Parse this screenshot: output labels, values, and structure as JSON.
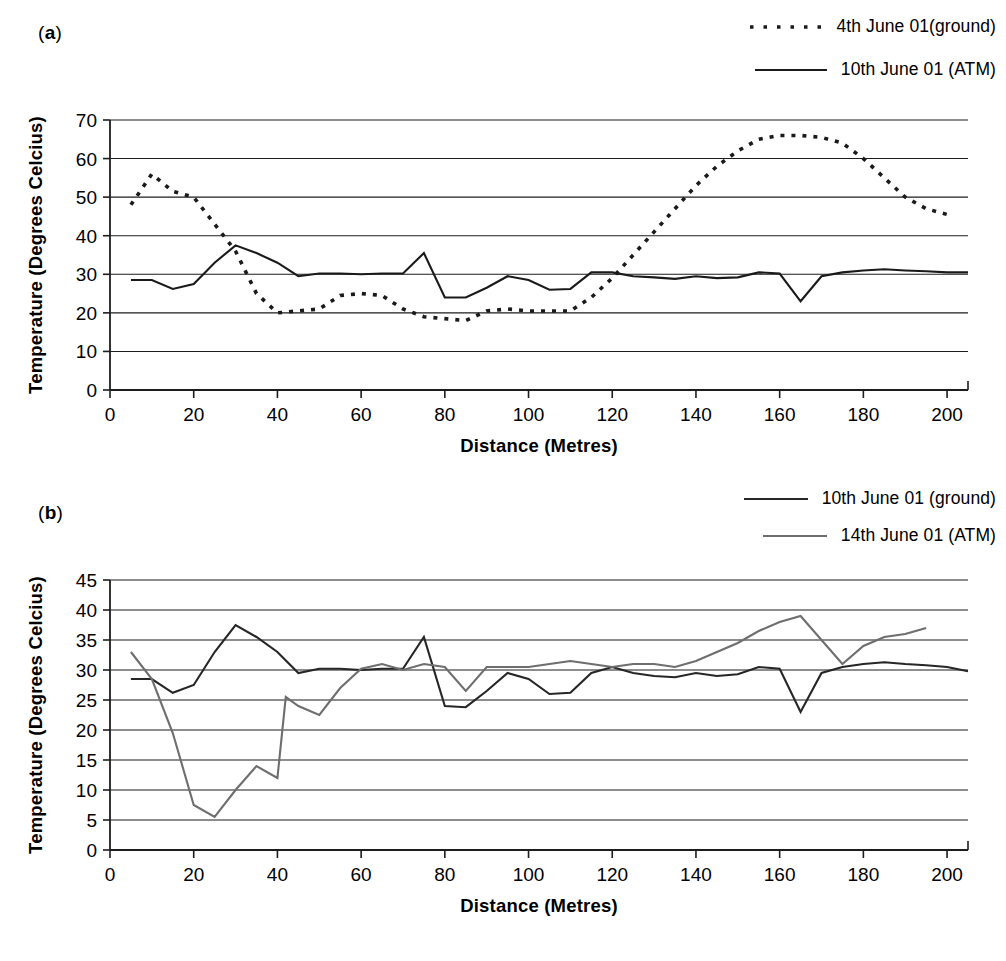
{
  "figure": {
    "panels": [
      {
        "id": "a",
        "label_open": "(",
        "label_letter": "a",
        "label_close": ")",
        "legend": [
          {
            "label": "4th June 01(ground)",
            "style": "dotted",
            "color": "#1a1a1a"
          },
          {
            "label": "10th June 01 (ATM)",
            "style": "solid",
            "color": "#1a1a1a"
          }
        ]
      },
      {
        "id": "b",
        "label_open": "(",
        "label_letter": "b",
        "label_close": ")",
        "legend": [
          {
            "label": "10th June 01 (ground)",
            "style": "solid",
            "color": "#262626"
          },
          {
            "label": "14th June 01 (ATM)",
            "style": "solid",
            "color": "#6e6e6e"
          }
        ]
      }
    ]
  },
  "chart_data": [
    {
      "panel": "a",
      "type": "line",
      "title": "",
      "xlabel": "Distance (Metres)",
      "ylabel": "Temperature (Degrees Celcius)",
      "xlim": [
        0,
        205
      ],
      "ylim": [
        0,
        70
      ],
      "xticks": [
        0,
        20,
        40,
        60,
        80,
        100,
        120,
        140,
        160,
        180,
        200
      ],
      "yticks": [
        0,
        10,
        20,
        30,
        40,
        50,
        60,
        70
      ],
      "grid": "horizontal",
      "legend_position": "top-right",
      "series": [
        {
          "name": "4th June 01(ground)",
          "style": "dotted",
          "color": "#1a1a1a",
          "x": [
            5,
            10,
            15,
            20,
            25,
            30,
            35,
            40,
            45,
            50,
            55,
            60,
            65,
            70,
            75,
            80,
            85,
            90,
            95,
            100,
            105,
            110,
            115,
            120,
            125,
            130,
            135,
            140,
            145,
            150,
            155,
            160,
            165,
            170,
            175,
            180,
            185,
            190,
            195,
            200
          ],
          "y": [
            48,
            56,
            51.5,
            50,
            43,
            36,
            25,
            20,
            20.5,
            21,
            24.5,
            25,
            24.5,
            21,
            19,
            18.5,
            18,
            20.5,
            21,
            20.5,
            20.5,
            20.5,
            24,
            29,
            35,
            41,
            47,
            53,
            58,
            62,
            65,
            66,
            66,
            65.5,
            64,
            60,
            55,
            50,
            47,
            45.5
          ]
        },
        {
          "name": "10th June 01 (ATM)",
          "style": "solid",
          "color": "#1a1a1a",
          "x": [
            5,
            10,
            15,
            20,
            25,
            30,
            35,
            40,
            45,
            50,
            55,
            60,
            65,
            70,
            75,
            80,
            85,
            90,
            95,
            100,
            105,
            110,
            115,
            120,
            125,
            130,
            135,
            140,
            145,
            150,
            155,
            160,
            165,
            170,
            175,
            180,
            185,
            190,
            195,
            200,
            205
          ],
          "y": [
            28.5,
            28.5,
            26.2,
            27.5,
            33,
            37.5,
            35.5,
            33,
            29.5,
            30.2,
            30.2,
            30,
            30.2,
            30.2,
            35.5,
            24,
            24,
            26.5,
            29.5,
            28.5,
            26,
            26.2,
            30.5,
            30.5,
            29.5,
            29.2,
            28.8,
            29.5,
            29,
            29.2,
            30.5,
            30.2,
            23,
            29.5,
            30.5,
            31,
            31.3,
            31,
            30.8,
            30.5,
            30.5
          ]
        }
      ]
    },
    {
      "panel": "b",
      "type": "line",
      "title": "",
      "xlabel": "Distance (Metres)",
      "ylabel": "Temperature (Degrees Celcius)",
      "xlim": [
        0,
        205
      ],
      "ylim": [
        0,
        45
      ],
      "xticks": [
        0,
        20,
        40,
        60,
        80,
        100,
        120,
        140,
        160,
        180,
        200
      ],
      "yticks": [
        0,
        5,
        10,
        15,
        20,
        25,
        30,
        35,
        40,
        45
      ],
      "grid": "horizontal",
      "legend_position": "top-right",
      "series": [
        {
          "name": "10th June 01 (ground)",
          "style": "solid",
          "color": "#262626",
          "x": [
            5,
            10,
            15,
            20,
            25,
            30,
            35,
            40,
            45,
            50,
            55,
            60,
            65,
            70,
            75,
            80,
            85,
            90,
            95,
            100,
            105,
            110,
            115,
            120,
            125,
            130,
            135,
            140,
            145,
            150,
            155,
            160,
            165,
            170,
            175,
            180,
            185,
            190,
            195,
            200,
            205
          ],
          "y": [
            28.5,
            28.5,
            26.2,
            27.5,
            33,
            37.5,
            35.5,
            33,
            29.5,
            30.2,
            30.2,
            30,
            30.2,
            30.2,
            35.5,
            24,
            23.8,
            26.5,
            29.5,
            28.5,
            26,
            26.2,
            29.5,
            30.5,
            29.5,
            29,
            28.8,
            29.5,
            29,
            29.3,
            30.5,
            30.2,
            23,
            29.5,
            30.5,
            31,
            31.3,
            31,
            30.8,
            30.5,
            29.8
          ]
        },
        {
          "name": "14th June 01 (ATM)",
          "style": "solid",
          "color": "#6e6e6e",
          "x": [
            5,
            10,
            15,
            20,
            25,
            30,
            35,
            40,
            42,
            45,
            50,
            55,
            60,
            65,
            70,
            75,
            80,
            85,
            90,
            95,
            100,
            105,
            110,
            115,
            120,
            125,
            130,
            135,
            140,
            145,
            150,
            155,
            160,
            165,
            170,
            175,
            180,
            185,
            190,
            195
          ],
          "y": [
            33,
            28.5,
            19.5,
            7.5,
            5.5,
            10,
            14,
            12,
            25.5,
            24,
            22.5,
            27,
            30.2,
            31,
            30,
            31,
            30.5,
            26.5,
            30.5,
            30.5,
            30.5,
            31,
            31.5,
            31,
            30.5,
            31,
            31,
            30.5,
            31.5,
            33,
            34.5,
            36.5,
            38,
            39,
            35,
            31,
            34,
            35.5,
            36,
            37
          ]
        }
      ]
    }
  ]
}
